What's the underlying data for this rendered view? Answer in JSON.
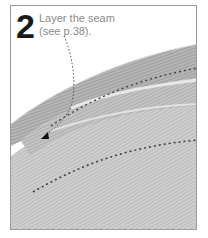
{
  "step": {
    "number": "2",
    "caption_line1": "Layer the seam",
    "caption_line2": "(see p.38)."
  },
  "illustration": {
    "subject": "layered fabric seam with stitching",
    "colors": {
      "frame_border": "#9a9a9a",
      "fabric_light": "#d8d8d8",
      "fabric_mid": "#b8b8b8",
      "fabric_dark": "#8c8c8c",
      "stitch": "#3a3a3a",
      "leader_line": "#555555",
      "step_number": "#1a1a1a",
      "caption_text": "#8a8a8a"
    }
  }
}
